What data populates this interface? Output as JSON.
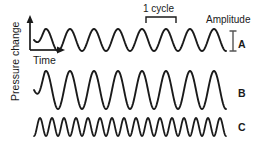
{
  "figure": {
    "background_color": "#ffffff",
    "stroke_color": "#1a1a1a",
    "width": 268,
    "height": 147
  },
  "axes": {
    "y_label": "Pressure change",
    "x_label": "Time",
    "y_axis_name": "pressure-change-axis",
    "x_axis_name": "time-axis",
    "origin_x": 30,
    "origin_y": 50,
    "y_top": 18
  },
  "annotations": {
    "cycle_label": "1 cycle",
    "cycle_bracket_start_x": 146,
    "cycle_bracket_end_x": 176,
    "cycle_bracket_y": 17,
    "amplitude_label": "Amplitude",
    "amplitude_bar_x": 233,
    "amplitude_bar_top": 31,
    "amplitude_bar_bottom": 51
  },
  "chart_data": {
    "type": "line",
    "xlabel": "Time",
    "ylabel": "Pressure change",
    "grid": false,
    "legend": "right-labels",
    "annotations": [
      {
        "text": "1 cycle",
        "target": "wave-a",
        "span_cycles": 1
      },
      {
        "text": "Amplitude",
        "target": "wave-a",
        "measure": "peak-to-trough"
      }
    ],
    "series": [
      {
        "name": "A",
        "label": "A",
        "description": "medium amplitude, low frequency",
        "cycles": 8,
        "amplitude_px": 11,
        "baseline_y": 40,
        "start_x": 34,
        "end_x": 226,
        "fade_in": true
      },
      {
        "name": "B",
        "label": "B",
        "description": "large amplitude, low frequency",
        "cycles": 8,
        "amplitude_px": 19,
        "baseline_y": 90,
        "start_x": 34,
        "end_x": 226,
        "fade_in": true
      },
      {
        "name": "C",
        "label": "C",
        "description": "small amplitude, high frequency",
        "cycles": 16,
        "amplitude_px": 9,
        "baseline_y": 127,
        "start_x": 34,
        "end_x": 226,
        "fade_in": false
      }
    ]
  }
}
